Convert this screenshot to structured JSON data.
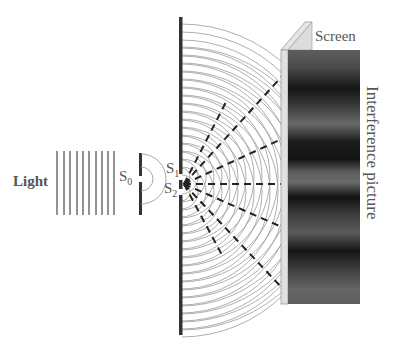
{
  "diagram": {
    "labels": {
      "light": "Light",
      "s0_main": "S",
      "s0_sub": "0",
      "s1_main": "S",
      "s1_sub": "1",
      "s2_main": "S",
      "s2_sub": "2",
      "screen": "Screen",
      "interference": "Interference picture"
    },
    "components": [
      {
        "id": "light-source",
        "description": "Incident plane waves (vertical lines)",
        "count": 10
      },
      {
        "id": "single-slit-barrier",
        "slit": "S0"
      },
      {
        "id": "double-slit-barrier",
        "slits": [
          "S1",
          "S2"
        ]
      },
      {
        "id": "screen",
        "shows": "interference fringes"
      }
    ],
    "rays": {
      "count": 7,
      "style": "dashed",
      "origin": "between S1 and S2"
    },
    "colors": {
      "text": "#555555",
      "barrier": "#333333",
      "wavefront": "#9a9a9a",
      "ray": "#222222",
      "screen_frame": "#d8d8d8",
      "fringe_dark": "#111111",
      "fringe_light": "#6a6a6a"
    }
  }
}
